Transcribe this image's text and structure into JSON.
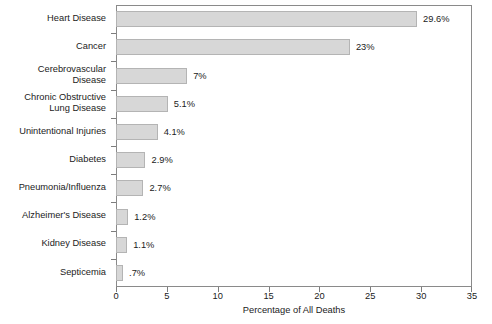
{
  "chart_data": {
    "type": "bar",
    "orientation": "horizontal",
    "title": "",
    "xlabel": "Percentage of All Deaths",
    "ylabel": "",
    "xlim": [
      0,
      35
    ],
    "xticks": [
      0,
      5,
      10,
      15,
      20,
      25,
      30,
      35
    ],
    "xtick_labels": [
      "0",
      "5",
      "10",
      "15",
      "20",
      "25",
      "30",
      "35"
    ],
    "grid": false,
    "legend": null,
    "bar_color": "#d7d7d7",
    "bar_edge_color": "#b4b4b4",
    "axis_color": "#8a8a8a",
    "categories": [
      "Heart Disease",
      "Cancer",
      "Cerebrovascular\nDisease",
      "Chronic Obstructive\nLung Disease",
      "Unintentional Injuries",
      "Diabetes",
      "Pneumonia/Influenza",
      "Alzheimer's Disease",
      "Kidney Disease",
      "Septicemia"
    ],
    "values": [
      29.6,
      23,
      7,
      5.1,
      4.1,
      2.9,
      2.7,
      1.2,
      1.1,
      0.7
    ],
    "value_labels": [
      "29.6%",
      "23%",
      "7%",
      "5.1%",
      "4.1%",
      "2.9%",
      "2.7%",
      "1.2%",
      "1.1%",
      ".7%"
    ]
  }
}
